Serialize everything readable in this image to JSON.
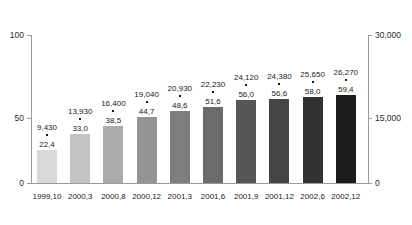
{
  "chart_data": {
    "type": "bar",
    "title": "",
    "xlabel": "",
    "ylabel": "",
    "categories": [
      "1999,10",
      "2000,3",
      "2000,8",
      "2000,12",
      "2001,3",
      "2001,6",
      "2001,9",
      "2001,12",
      "2002,6",
      "2002,12"
    ],
    "series": [
      {
        "name": "percent",
        "axis": "left",
        "values": [
          22.4,
          33.0,
          38.5,
          44.7,
          48.6,
          51.6,
          56.0,
          56.6,
          58.0,
          59.4
        ],
        "labels": [
          "22,4",
          "33,0",
          "38,5",
          "44,7",
          "48,6",
          "51,6",
          "56,0",
          "56,6",
          "58,0",
          "59,4"
        ]
      },
      {
        "name": "total",
        "axis": "right",
        "values": [
          9430,
          13930,
          16400,
          19040,
          20930,
          22230,
          24120,
          24380,
          25650,
          26270
        ],
        "labels": [
          "9,430",
          "13,930",
          "16,400",
          "19,040",
          "20,930",
          "22,230",
          "24,120",
          "24,380",
          "25,650",
          "26,270"
        ]
      }
    ],
    "left_axis": {
      "ticks": [
        0,
        50,
        100
      ],
      "tick_labels": [
        "0",
        "50",
        "100"
      ],
      "min": 0,
      "max": 100
    },
    "right_axis": {
      "ticks": [
        0,
        15000,
        30000
      ],
      "tick_labels": [
        "0",
        "15,000",
        "30,000"
      ],
      "min": 0,
      "max": 30000
    },
    "grid": false,
    "legend": "none",
    "bar_colors": [
      "#d9d9d9",
      "#c4c4c4",
      "#ababab",
      "#949494",
      "#7e7e7e",
      "#6b6b6b",
      "#565656",
      "#454545",
      "#313131",
      "#1c1c1c"
    ]
  }
}
